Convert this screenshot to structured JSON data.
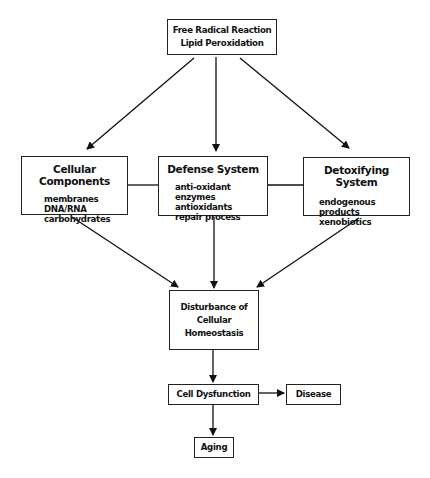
{
  "nodes": {
    "top": {
      "lines": [
        "Free Radical Reaction",
        "Lipid Peroxidation"
      ]
    },
    "cellular": {
      "title": "Cellular Components",
      "items": [
        "membranes",
        "DNA/RNA",
        "carbohydrates"
      ]
    },
    "defense": {
      "title": "Defense System",
      "items": [
        "anti-oxidant enzymes",
        "antioxidants",
        "repair process"
      ]
    },
    "detox": {
      "title": "Detoxifying System",
      "items": [
        "endogenous products",
        "xenobiotics"
      ]
    },
    "homeostasis": {
      "lines": [
        "Disturbance of",
        "Cellular Homeostasis"
      ]
    },
    "dysfunction": {
      "label": "Cell Dysfunction"
    },
    "disease": {
      "label": "Disease"
    },
    "aging": {
      "label": "Aging"
    }
  },
  "edges": [
    {
      "from": "top",
      "to": "cellular"
    },
    {
      "from": "top",
      "to": "defense"
    },
    {
      "from": "top",
      "to": "detox"
    },
    {
      "from": "cellular",
      "to": "defense",
      "type": "line"
    },
    {
      "from": "defense",
      "to": "detox",
      "type": "line"
    },
    {
      "from": "cellular",
      "to": "homeostasis"
    },
    {
      "from": "defense",
      "to": "homeostasis"
    },
    {
      "from": "detox",
      "to": "homeostasis"
    },
    {
      "from": "homeostasis",
      "to": "dysfunction"
    },
    {
      "from": "dysfunction",
      "to": "disease"
    },
    {
      "from": "dysfunction",
      "to": "aging"
    }
  ]
}
